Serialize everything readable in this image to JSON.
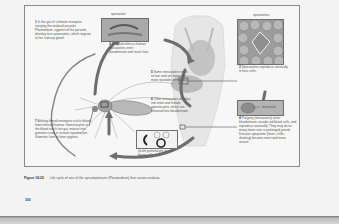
{
  "figure": {
    "number": "Figure 18.20",
    "caption": "Life cycle of one of the apicomplexans (Plasmodium) that causes malaria.",
    "page_number": "300"
  },
  "steps": [
    {
      "id": "1",
      "text": "In the gut of a female mosquito carrying the malarial parasite Plasmodium, zygotes of the parasite develop into sporozoites, which migrate to her salivary gland."
    },
    {
      "id": "2",
      "text": "Mosquito bites a human; sporozoites enter bloodstream and reach liver."
    },
    {
      "id": "3",
      "text": "Sporozoites reproduce asexually in liver cells."
    },
    {
      "id": "4",
      "text": "Progeny (merozoites) enter bloodstream, invade red blood cells, and reproduce asexually. They may do so many times over a prolonged period. Disease symptoms (fever, chills, shaking) become more and more severe."
    },
    {
      "id": "5",
      "text": "Some merozoites return to liver and are basis for more episodes of malaria."
    },
    {
      "id": "6",
      "text": "Other merozoites develop into male and female gametocytes, which are released into bloodstream."
    },
    {
      "id": "7",
      "text": "A biting female mosquito sucks blood from infected human. Gametocytes in the blood reach her gut, mature into gametes used in sexual reproduction. Gametes fuse to form zygotes."
    }
  ],
  "insets": {
    "sporozoite_label": "sporozoite",
    "sporozoites_label": "sporozoites",
    "merozoite_label": "merozoite",
    "gametocyte_label": "(male gametocyte in red blood cell)"
  },
  "colors": {
    "arrow": "#6e6e6e",
    "inset_fill": "#b8b8b8",
    "border": "#8a8a8a"
  }
}
